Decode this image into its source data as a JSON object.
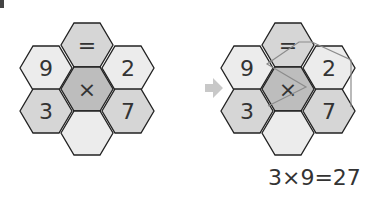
{
  "colors": {
    "light": "#ececec",
    "medium": "#d6d6d6",
    "dark": "#bdbdbd",
    "stroke": "#222222",
    "text": "#333333",
    "path": "#8c8c8c",
    "arrow": "#c8c8c8"
  },
  "left_puzzle": {
    "cells": [
      {
        "pos": "top",
        "symbol": "="
      },
      {
        "pos": "upper-left",
        "symbol": "9"
      },
      {
        "pos": "upper-right",
        "symbol": "2"
      },
      {
        "pos": "center",
        "symbol": "×"
      },
      {
        "pos": "lower-left",
        "symbol": "3"
      },
      {
        "pos": "lower-right",
        "symbol": "7"
      },
      {
        "pos": "bottom",
        "symbol": ""
      }
    ]
  },
  "right_puzzle": {
    "cells": [
      {
        "pos": "top",
        "symbol": "="
      },
      {
        "pos": "upper-left",
        "symbol": "9"
      },
      {
        "pos": "upper-right",
        "symbol": "2"
      },
      {
        "pos": "center",
        "symbol": "×"
      },
      {
        "pos": "lower-left",
        "symbol": "3"
      },
      {
        "pos": "lower-right",
        "symbol": "7"
      },
      {
        "pos": "bottom",
        "symbol": ""
      }
    ],
    "solution_path": [
      "3",
      "×",
      "9",
      "=",
      "2",
      "7"
    ]
  },
  "equation": "3×9=27"
}
